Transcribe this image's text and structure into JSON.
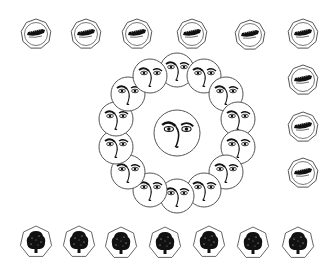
{
  "scene": {
    "background": "#ffffff",
    "stroke": "#555555",
    "ink": "#111111"
  },
  "boats": [
    {
      "x": 36,
      "y": 34
    },
    {
      "x": 86,
      "y": 34
    },
    {
      "x": 137,
      "y": 34
    },
    {
      "x": 192,
      "y": 34
    },
    {
      "x": 250,
      "y": 35
    },
    {
      "x": 303,
      "y": 34
    },
    {
      "x": 303,
      "y": 80
    },
    {
      "x": 303,
      "y": 127
    },
    {
      "x": 303,
      "y": 173
    }
  ],
  "center_face": {
    "x": 177,
    "y": 133,
    "r": 23
  },
  "face_ring": {
    "cx": 177,
    "cy": 133,
    "radius": 63,
    "count": 14,
    "face_r": 17,
    "start_deg": -90
  },
  "trees": [
    {
      "x": 36,
      "y": 242
    },
    {
      "x": 79,
      "y": 242
    },
    {
      "x": 121,
      "y": 243
    },
    {
      "x": 165,
      "y": 243
    },
    {
      "x": 209,
      "y": 242
    },
    {
      "x": 253,
      "y": 243
    },
    {
      "x": 298,
      "y": 243
    }
  ]
}
